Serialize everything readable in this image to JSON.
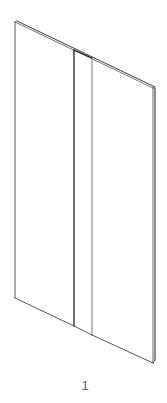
{
  "diagram": {
    "type": "isometric-panel-drawing",
    "part_label": "1",
    "colors": {
      "line": "#333333",
      "edge_light": "#888888",
      "background": "#ffffff",
      "label": "#666666"
    },
    "panels": [
      {
        "name": "left-panel",
        "top_left": [
          15,
          22
        ],
        "top_right": [
          74,
          50
        ],
        "bottom_left": [
          15,
          298
        ],
        "bottom_right": [
          74,
          326
        ]
      },
      {
        "name": "center-strip",
        "top_left": [
          74,
          50
        ],
        "top_right": [
          92,
          58
        ],
        "bottom_left": [
          74,
          326
        ],
        "bottom_right": [
          92,
          335
        ]
      },
      {
        "name": "right-panel",
        "top_left": [
          92,
          58
        ],
        "top_right": [
          153,
          88
        ],
        "bottom_left": [
          92,
          335
        ],
        "bottom_right": [
          153,
          363
        ]
      }
    ]
  }
}
